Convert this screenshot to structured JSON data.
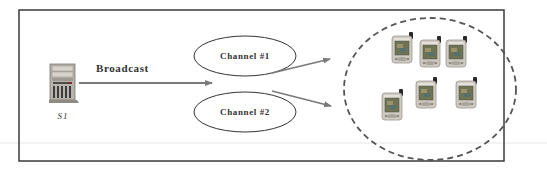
{
  "diagram": {
    "type": "broadcast-channel-diagram",
    "server": {
      "label": "S1",
      "icon": "server-tower-icon"
    },
    "broadcast_edge": {
      "label": "Broadcast"
    },
    "channels": [
      {
        "label": "Channel #1"
      },
      {
        "label": "Channel #2"
      }
    ],
    "client_group": {
      "shape": "dashed-ellipse",
      "devices": [
        {
          "icon": "pda-icon"
        },
        {
          "icon": "pda-icon"
        },
        {
          "icon": "pda-icon"
        },
        {
          "icon": "pda-icon"
        },
        {
          "icon": "pda-icon"
        },
        {
          "icon": "pda-icon"
        }
      ]
    },
    "colors": {
      "border": "#3a3a3a",
      "arrow": "#7a7a7a",
      "ellipse_stroke": "#333333",
      "dashed": "#555555",
      "pda_body": "#c9c4bc",
      "pda_screen": "#6b6f52"
    }
  }
}
